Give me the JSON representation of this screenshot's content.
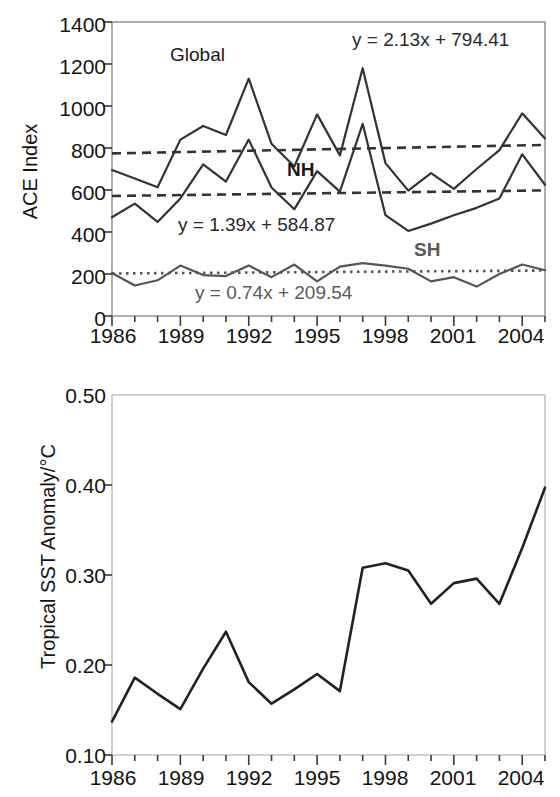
{
  "figure": {
    "panels": [
      "ace-index-panel",
      "tropical-sst-panel"
    ]
  },
  "ace_panel": {
    "ylabel": "ACE Index",
    "yticks": [
      "0",
      "200",
      "400",
      "600",
      "800",
      "1000",
      "1200",
      "1400"
    ],
    "xticks": [
      "1986",
      "1989",
      "1992",
      "1995",
      "1998",
      "2001",
      "2004"
    ],
    "series_labels": {
      "global": "Global",
      "nh": "NH",
      "sh": "SH"
    },
    "equations": {
      "global": "y = 2.13x + 794.41",
      "nh": "y = 1.39x + 584.87",
      "sh": "y = 0.74x + 209.54"
    }
  },
  "sst_panel": {
    "ylabel": "Tropical SST Anomaly/°C",
    "yticks": [
      "0.10",
      "0.20",
      "0.30",
      "0.40",
      "0.50"
    ],
    "xticks": [
      "1986",
      "1989",
      "1992",
      "1995",
      "1998",
      "2001",
      "2004"
    ]
  },
  "chart_data": [
    {
      "type": "line",
      "id": "ace-index-panel",
      "title": "",
      "xlabel": "",
      "ylabel": "ACE Index",
      "xlim": [
        1986,
        2005
      ],
      "ylim": [
        0,
        1400
      ],
      "xticks": [
        1986,
        1989,
        1992,
        1995,
        1998,
        2001,
        2004
      ],
      "yticks": [
        0,
        200,
        400,
        600,
        800,
        1000,
        1200,
        1400
      ],
      "minor_xticks_every": 1,
      "grid": false,
      "legend": "inline-annotations",
      "x": [
        1986,
        1987,
        1988,
        1989,
        1990,
        1991,
        1992,
        1993,
        1994,
        1995,
        1996,
        1997,
        1998,
        1999,
        2000,
        2001,
        2002,
        2003,
        2004,
        2005
      ],
      "series": [
        {
          "name": "Global",
          "color": "#333333",
          "values": [
            695,
            655,
            613,
            840,
            905,
            862,
            1130,
            820,
            712,
            960,
            765,
            1180,
            728,
            597,
            680,
            605,
            700,
            790,
            965,
            845
          ],
          "trend": {
            "label": "y = 2.13x + 794.41",
            "slope": 2.13,
            "intercept": 794.41,
            "style": "dashed"
          }
        },
        {
          "name": "NH",
          "color": "#333333",
          "values": [
            470,
            535,
            448,
            560,
            722,
            640,
            840,
            612,
            508,
            690,
            592,
            915,
            480,
            405,
            440,
            480,
            515,
            560,
            770,
            625
          ],
          "trend": {
            "label": "y = 1.39x + 584.87",
            "slope": 1.39,
            "intercept": 584.87,
            "style": "dashed"
          }
        },
        {
          "name": "SH",
          "color": "#555555",
          "values": [
            205,
            145,
            170,
            240,
            195,
            190,
            240,
            185,
            245,
            165,
            235,
            252,
            240,
            225,
            165,
            185,
            140,
            200,
            245,
            218
          ],
          "trend": {
            "label": "y = 0.74x + 209.54",
            "slope": 0.74,
            "intercept": 209.54,
            "style": "dotted"
          }
        }
      ]
    },
    {
      "type": "line",
      "id": "tropical-sst-panel",
      "title": "",
      "xlabel": "",
      "ylabel": "Tropical SST Anomaly/°C",
      "xlim": [
        1986,
        2005
      ],
      "ylim": [
        0.1,
        0.5
      ],
      "xticks": [
        1986,
        1989,
        1992,
        1995,
        1998,
        2001,
        2004
      ],
      "yticks": [
        0.1,
        0.2,
        0.3,
        0.4,
        0.5
      ],
      "minor_xticks_every": 1,
      "grid": false,
      "x": [
        1986,
        1987,
        1988,
        1989,
        1990,
        1991,
        1992,
        1993,
        1994,
        1995,
        1996,
        1997,
        1998,
        1999,
        2000,
        2001,
        2002,
        2003,
        2004,
        2005
      ],
      "series": [
        {
          "name": "Tropical SST Anomaly",
          "color": "#222222",
          "values": [
            0.137,
            0.186,
            0.168,
            0.151,
            0.196,
            0.237,
            0.181,
            0.157,
            0.173,
            0.19,
            0.171,
            0.308,
            0.313,
            0.305,
            0.268,
            0.291,
            0.296,
            0.268,
            0.33,
            0.397
          ]
        }
      ]
    }
  ]
}
